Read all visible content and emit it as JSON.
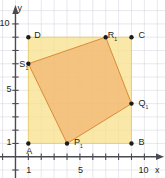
{
  "figure": {
    "type": "coordinate-plane-geometry",
    "background": "#ffffff",
    "axes": {
      "x_label": "x",
      "y_label": "y",
      "x_ticks_labeled": [
        {
          "value": 1,
          "text": "1"
        },
        {
          "value": 5,
          "text": "5"
        },
        {
          "value": 10,
          "text": "10"
        }
      ],
      "y_ticks_labeled": [
        {
          "value": 1,
          "text": "1"
        },
        {
          "value": 5,
          "text": "5"
        },
        {
          "value": 10,
          "text": "10"
        }
      ],
      "x_range": [
        -1.2,
        11.6
      ],
      "y_range": [
        -1.6,
        11.8
      ],
      "x_tick_every": 1,
      "y_tick_every": 1,
      "grid": true,
      "grid_color": "#d9d9e2",
      "axis_color": "#4a4a52",
      "arrow_x": true,
      "arrow_y": true
    },
    "square": {
      "name": "ABCD",
      "fill": "#f7e08a",
      "fill_opacity": 0.75,
      "stroke": "#e8c95e",
      "vertices": [
        {
          "label": "A",
          "sub": "",
          "x": 1,
          "y": 1,
          "lx": -4,
          "ly": 11
        },
        {
          "label": "B",
          "sub": "",
          "x": 9,
          "y": 1,
          "lx": 5,
          "ly": 2
        },
        {
          "label": "C",
          "sub": "",
          "x": 9,
          "y": 9,
          "lx": 5,
          "ly": 1
        },
        {
          "label": "D",
          "sub": "",
          "x": 1,
          "y": 9,
          "lx": 4,
          "ly": 1
        }
      ]
    },
    "quadrilateral": {
      "name": "P1Q1R1S1",
      "fill": "#f2b471",
      "fill_opacity": 0.72,
      "stroke": "#d98b3a",
      "vertices": [
        {
          "label": "P",
          "sub": "1",
          "x": 4,
          "y": 1,
          "lx": 5,
          "ly": 2
        },
        {
          "label": "Q",
          "sub": "1",
          "x": 9,
          "y": 4,
          "lx": 5,
          "ly": 2
        },
        {
          "label": "R",
          "sub": "1",
          "x": 7,
          "y": 9,
          "lx": 0,
          "ly": 1
        },
        {
          "label": "S",
          "sub": "1",
          "x": 1,
          "y": 7,
          "lx": -11,
          "ly": 3
        }
      ]
    },
    "point_color": "#1b1b1b",
    "point_radius": 2.2
  }
}
